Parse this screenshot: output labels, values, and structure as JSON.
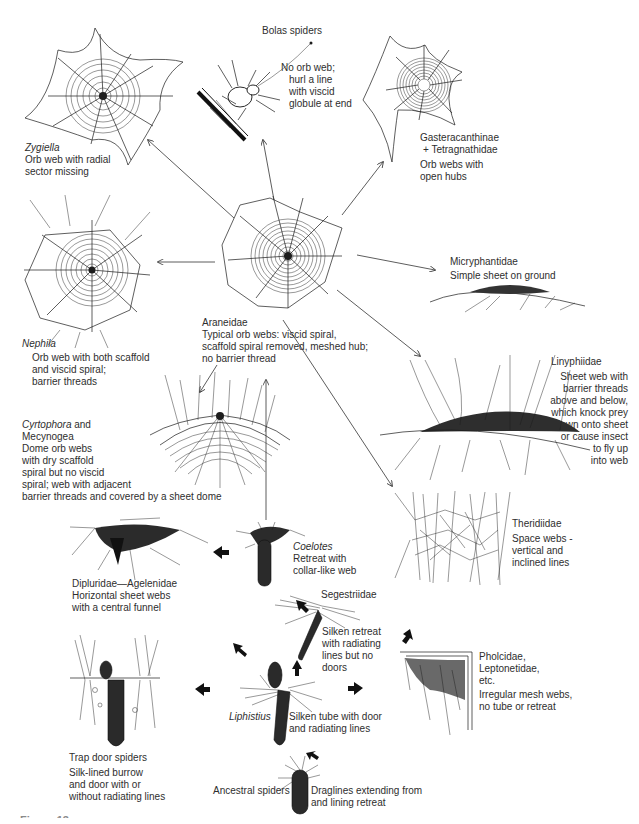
{
  "diagram": {
    "nodes": [
      {
        "id": "zygiella",
        "name": "Zygiella",
        "name_italic": true,
        "desc": [
          "Orb web with radial",
          "sector missing"
        ]
      },
      {
        "id": "bolas",
        "name": "Bolas spiders",
        "name_italic": false,
        "desc": [
          "No orb web;",
          "hurl a line",
          "with viscid",
          "globule at end"
        ]
      },
      {
        "id": "gasteracanthinae",
        "name": "Gasteracanthinae",
        "name2": "+ Tetragnathidae",
        "desc": [
          "Orb webs with",
          "open hubs"
        ]
      },
      {
        "id": "nephila",
        "name": "Nephila",
        "name_italic": true,
        "desc": [
          "Orb web with both scaffold",
          "and viscid spiral;",
          "barrier threads"
        ]
      },
      {
        "id": "araneidae",
        "name": "Araneidae",
        "desc": [
          "Typical orb webs: viscid spiral,",
          "scaffold spiral removed, meshed hub;",
          "no barrier thread"
        ]
      },
      {
        "id": "micryphantidae",
        "name": "Micryphantidae",
        "desc": [
          "Simple sheet on ground"
        ]
      },
      {
        "id": "linyphiidae",
        "name": "Linyphiidae",
        "desc": [
          "Sheet web with",
          "barrier threads",
          "above and below,",
          "which knock prey",
          "down onto sheet",
          "or cause insect",
          "to fly up",
          "into web"
        ]
      },
      {
        "id": "cyrtophora",
        "name": "Cyrtophora",
        "name_italic": true,
        "name_suffix": " and",
        "name2": "Mecynogea",
        "desc": [
          "Dome orb webs",
          "with dry scaffold",
          "spiral but no viscid",
          "spiral; web with adjacent",
          "barrier threads and covered by a sheet dome"
        ]
      },
      {
        "id": "theridiidae",
        "name": "Theridiidae",
        "desc": [
          "Space webs -",
          "vertical and",
          "inclined lines"
        ]
      },
      {
        "id": "dipluridae",
        "name": "Dipluridae—Agelenidae",
        "desc": [
          "Horizontal sheet webs",
          "with a central funnel"
        ]
      },
      {
        "id": "coelotes",
        "name": "Coelotes",
        "name_italic": true,
        "desc": [
          "Retreat with",
          "collar-like web"
        ]
      },
      {
        "id": "segestriidae",
        "name": "Segestriidae",
        "desc": [
          "Silken retreat",
          "with radiating",
          "lines but no",
          "doors"
        ]
      },
      {
        "id": "pholcidae",
        "name": "Pholcidae,",
        "name2": "Leptonetidae,",
        "name3": "etc.",
        "desc": [
          "Irregular mesh webs,",
          "no tube or retreat"
        ]
      },
      {
        "id": "trapdoor",
        "name": "Trap door spiders",
        "desc": [
          "Silk-lined burrow",
          "and door with or",
          "without radiating lines"
        ]
      },
      {
        "id": "liphistius",
        "name": "Liphistius",
        "name_italic": true,
        "desc": [
          "Silken tube with door",
          "and radiating lines"
        ]
      },
      {
        "id": "ancestral",
        "name": "Ancestral spiders",
        "desc": [
          "Draglines extending from",
          "and lining retreat"
        ]
      }
    ],
    "edges": [
      {
        "from": "araneidae",
        "to": "zygiella",
        "style": "thin"
      },
      {
        "from": "araneidae",
        "to": "bolas",
        "style": "thin"
      },
      {
        "from": "araneidae",
        "to": "gasteracanthinae",
        "style": "thin"
      },
      {
        "from": "araneidae",
        "to": "nephila",
        "style": "thin"
      },
      {
        "from": "araneidae",
        "to": "micryphantidae",
        "style": "thin"
      },
      {
        "from": "araneidae",
        "to": "linyphiidae",
        "style": "thin"
      },
      {
        "from": "araneidae",
        "to": "cyrtophora",
        "style": "thin"
      },
      {
        "from": "araneidae",
        "to": "theridiidae",
        "style": "thin"
      },
      {
        "from": "coelotes",
        "to": "araneidae",
        "style": "thin"
      },
      {
        "from": "coelotes",
        "to": "dipluridae",
        "style": "bold"
      },
      {
        "from": "segestriidae",
        "to": "coelotes",
        "style": "bold"
      },
      {
        "from": "liphistius",
        "to": "segestriidae",
        "style": "bold"
      },
      {
        "from": "liphistius",
        "to": "coelotes",
        "style": "bold"
      },
      {
        "from": "liphistius",
        "to": "trapdoor",
        "style": "bold"
      },
      {
        "from": "liphistius",
        "to": "pholcidae",
        "style": "bold"
      },
      {
        "from": "pholcidae",
        "to": "theridiidae",
        "style": "bold"
      },
      {
        "from": "ancestral",
        "to": "liphistius",
        "style": "bold"
      }
    ],
    "caption_partial": "Figure 13"
  }
}
